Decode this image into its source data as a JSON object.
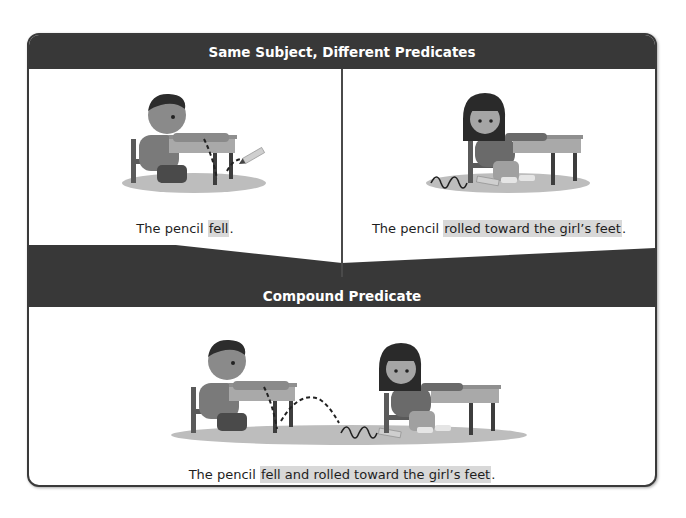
{
  "sections": {
    "top": {
      "title": "Same Subject, Different Predicates",
      "left": {
        "illustration": "boy-at-desk-pencil-falling",
        "caption_subject": "The pencil ",
        "caption_predicate": "fell",
        "caption_end": "."
      },
      "right": {
        "illustration": "girl-at-desk-pencil-rolling",
        "caption_subject": "The pencil ",
        "caption_predicate": "rolled toward the girl’s feet",
        "caption_end": "."
      }
    },
    "bottom": {
      "title": "Compound Predicate",
      "illustration": "boy-and-girl-pencil-falls-and-rolls",
      "caption_subject": "The pencil ",
      "caption_predicate": "fell and rolled toward the girl’s feet",
      "caption_end": "."
    }
  },
  "colors": {
    "header_bg": "#383838",
    "header_text": "#ffffff",
    "highlight": "#d8d8d8",
    "border": "#3a3a3a"
  }
}
